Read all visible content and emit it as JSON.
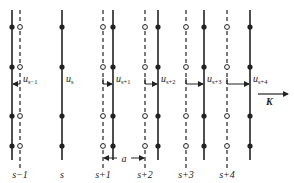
{
  "figure": {
    "colors": {
      "line": "#222222",
      "background": "#ffffff"
    },
    "dot_y": [
      27,
      67,
      116,
      146
    ],
    "arrow_y": 84,
    "line_top": 10,
    "line_bottom": 160,
    "planes": [
      {
        "index": "s-1",
        "label": "s−1",
        "equilibrium_x": 20,
        "displaced_x": 12,
        "displacement_label": "u",
        "displacement_sub": "s−1",
        "direction": "left"
      },
      {
        "index": "s",
        "label": "s",
        "equilibrium_x": 62,
        "displaced_x": 62,
        "displacement_label": "u",
        "displacement_sub": "s",
        "direction": "none"
      },
      {
        "index": "s+1",
        "label": "s+1",
        "equilibrium_x": 103,
        "displaced_x": 113,
        "displacement_label": "u",
        "displacement_sub": "s+1",
        "direction": "right"
      },
      {
        "index": "s+2",
        "label": "s+2",
        "equilibrium_x": 145,
        "displaced_x": 158,
        "displacement_label": "u",
        "displacement_sub": "s+2",
        "direction": "right"
      },
      {
        "index": "s+3",
        "label": "s+3",
        "equilibrium_x": 186,
        "displaced_x": 204,
        "displacement_label": "u",
        "displacement_sub": "s+3",
        "direction": "right"
      },
      {
        "index": "s+4",
        "label": "s+4",
        "equilibrium_x": 227,
        "displaced_x": 250,
        "displacement_label": "u",
        "displacement_sub": "s+4",
        "direction": "right"
      }
    ],
    "spacing": {
      "label": "a",
      "from_x": 103,
      "to_x": 145,
      "y": 158
    },
    "wavevector": {
      "label": "K",
      "x1": 258,
      "x2": 288,
      "y": 94
    }
  }
}
